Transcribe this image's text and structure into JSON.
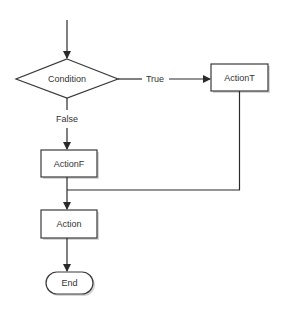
{
  "diagram": {
    "type": "flowchart",
    "colors": {
      "stroke": "#3a3a3a",
      "fill": "#ffffff",
      "text": "#333333",
      "shadow": "#cfcfcf"
    },
    "nodes": {
      "condition": {
        "label": "Condition",
        "shape": "diamond"
      },
      "action_t": {
        "label": "ActionT",
        "shape": "rectangle"
      },
      "action_f": {
        "label": "ActionF",
        "shape": "rectangle"
      },
      "action": {
        "label": "Action",
        "shape": "rectangle"
      },
      "end": {
        "label": "End",
        "shape": "terminator"
      }
    },
    "edges": {
      "true_label": "True",
      "false_label": "False"
    }
  }
}
